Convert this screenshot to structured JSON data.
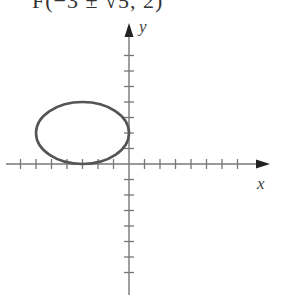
{
  "header": {
    "clipped_label": "F(−3 ± √5, 2)"
  },
  "axes": {
    "x_label": "x",
    "y_label": "y",
    "tick_spacing_px": 15.5,
    "origin_px": [
      129,
      164
    ],
    "x_ticks": [
      -7,
      -6,
      -5,
      -4,
      -3,
      -2,
      -1,
      1,
      2,
      3,
      4,
      5,
      6,
      7
    ],
    "y_ticks": [
      -7,
      -6,
      -5,
      -4,
      -3,
      -2,
      -1,
      1,
      2,
      3,
      4,
      5,
      6,
      7
    ]
  },
  "ellipse": {
    "center": [
      -3,
      2
    ],
    "semi_major_x": 3,
    "semi_minor_y": 2,
    "stroke_color": "#555555"
  },
  "colors": {
    "axis": "#777777",
    "curve": "#555555",
    "background": "#ffffff"
  }
}
